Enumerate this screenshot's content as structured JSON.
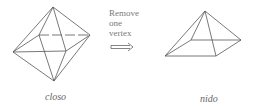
{
  "diagram": {
    "left_structure": {
      "caption": "closo",
      "shape": "octahedron"
    },
    "transformation": {
      "label_lines": [
        "Remove",
        "one",
        "vertex"
      ],
      "arrow": "double-arrow-right"
    },
    "right_structure": {
      "caption": "nido",
      "shape": "square-pyramid"
    },
    "colors": {
      "line": "#555555",
      "text": "#777777",
      "background": "#ffffff"
    }
  }
}
